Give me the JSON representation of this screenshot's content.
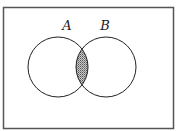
{
  "diagram": {
    "type": "venn",
    "universe": {
      "x": 3.5,
      "y": 7.5,
      "width": 170,
      "height": 121,
      "stroke": "#555555"
    },
    "sets": [
      {
        "id": "A",
        "label": "A",
        "cx": 58,
        "cy": 67,
        "r": 30,
        "label_x": 67,
        "label_y": 30
      },
      {
        "id": "B",
        "label": "B",
        "cx": 106,
        "cy": 67,
        "r": 30,
        "label_x": 105,
        "label_y": 30
      }
    ],
    "shaded_region": "A ∩ B",
    "colors": {
      "stroke": "#222222",
      "shade_fill": "#bdbdbd",
      "shade_dot": "#555555"
    }
  }
}
